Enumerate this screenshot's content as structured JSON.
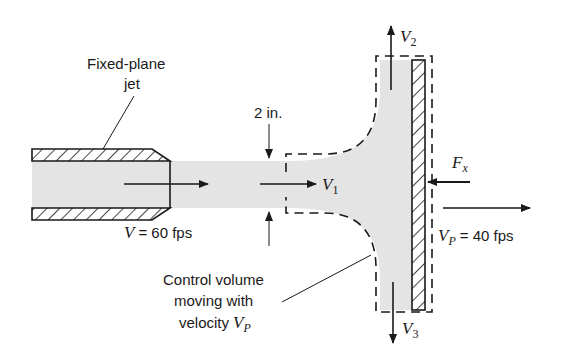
{
  "figure": {
    "colors": {
      "fluid": "#e4e4e4",
      "line": "#1a1a1a",
      "background": "#ffffff"
    },
    "labels": {
      "nozzle_line1": "Fixed-plane",
      "nozzle_line2": "jet",
      "diameter": "2 in.",
      "v1_sym": "V",
      "v1_sub": "1",
      "v2_sym": "V",
      "v2_sub": "2",
      "v3_sym": "V",
      "v3_sub": "3",
      "fx_sym": "F",
      "fx_sub": "x",
      "jet_velocity_sym": "V",
      "jet_velocity_value": "= 60 fps",
      "plate_velocity_sym": "V",
      "plate_velocity_sub": "P",
      "plate_velocity_value": "= 40 fps",
      "cv_line1": "Control volume",
      "cv_line2": "moving with",
      "cv_line3": "velocity",
      "cv_line3_sym": "V",
      "cv_line3_sub": "P"
    }
  }
}
